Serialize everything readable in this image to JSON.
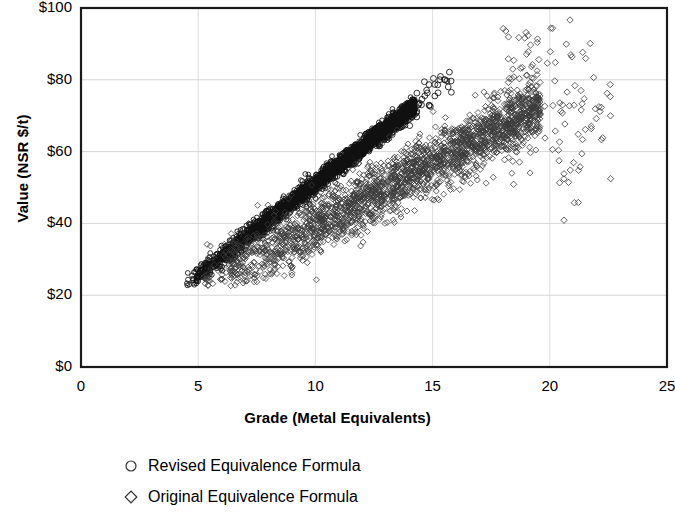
{
  "chart_data": {
    "type": "scatter",
    "title": "",
    "xlabel": "Grade (Metal Equivalents)",
    "ylabel": "Value (NSR $/t)",
    "xlim": [
      0,
      25
    ],
    "ylim": [
      0,
      100
    ],
    "xticks": [
      0,
      5,
      10,
      15,
      20,
      25
    ],
    "yticks": [
      0,
      20,
      40,
      60,
      80,
      100
    ],
    "xtick_labels": [
      "0",
      "5",
      "10",
      "15",
      "20",
      "25"
    ],
    "ytick_labels": [
      "$0",
      "$20",
      "$40",
      "$60",
      "$80",
      "$100"
    ],
    "grid": true,
    "grid_axes": "both",
    "legend_position": "below-left",
    "series": [
      {
        "name": "Revised Equivalence Formula",
        "marker": "circle",
        "color": "#111111",
        "x_range": [
          4.5,
          15.8
        ],
        "y_range": [
          23,
          97
        ],
        "slope": 5.1,
        "intercept": 0.1,
        "scatter_sd": 1.4,
        "n_points": 2600,
        "description": "Dense tight near-linear band of open circles rising steeply from about (4.5, $23) to (14.2, $86), with a sparse tail of circles continuing to about (15.8, $97)."
      },
      {
        "name": "Original Equivalence Formula",
        "marker": "diamond",
        "color": "#3b3b3b",
        "x_range": [
          5.0,
          22.6
        ],
        "y_range": [
          23,
          95
        ],
        "slope": 3.45,
        "intercept": 5.0,
        "scatter_sd": 4.2,
        "n_points": 2300,
        "description": "Broader, noisier band of open diamonds from about (5, $23) to (19.5, $87), with a spray of scattered outlier diamonds extending right to grade 22.6 and values between $55 and $95."
      }
    ]
  },
  "axes": {
    "y_title": "Value (NSR $/t)",
    "x_title": "Grade (Metal Equivalents)"
  },
  "legend": {
    "items": [
      {
        "marker": "circle-marker",
        "label": "Revised Equivalence Formula"
      },
      {
        "marker": "diamond-marker",
        "label": "Original Equivalence Formula"
      }
    ]
  }
}
